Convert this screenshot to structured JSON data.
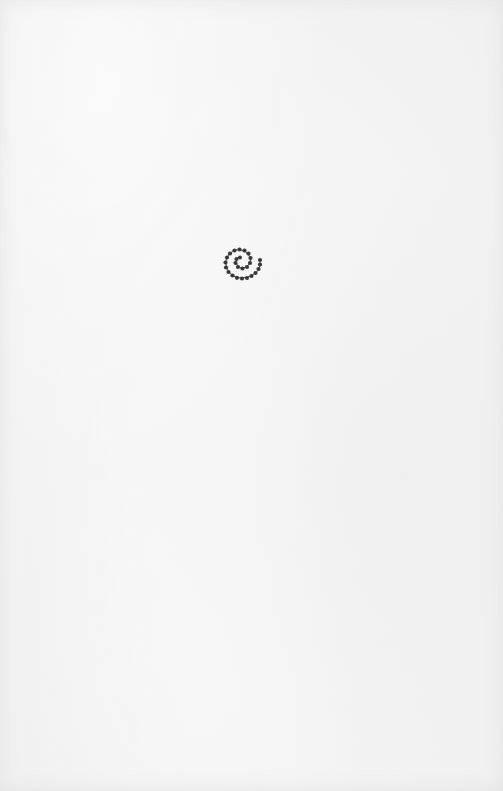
{
  "page": {
    "background_color": "#f4f4f4",
    "ornament": {
      "icon": "beaded-spiral-icon",
      "color": "#3a3a3a"
    }
  }
}
